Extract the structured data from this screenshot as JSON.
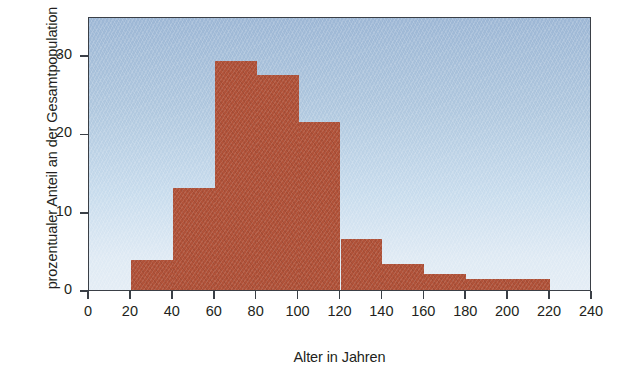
{
  "chart_data": {
    "type": "bar",
    "title": "",
    "subtitle": "",
    "xlabel": "Alter in Jahren",
    "ylabel": "prozentualer Anteil an der Gesamtpopulation",
    "xlim": [
      0,
      240
    ],
    "ylim": [
      0,
      35
    ],
    "bin_width": 20,
    "grid": false,
    "legend": null,
    "xticks": [
      0,
      20,
      40,
      60,
      80,
      100,
      120,
      140,
      160,
      180,
      200,
      220,
      240
    ],
    "xtick_labels": [
      "0",
      "20",
      "40",
      "60",
      "80",
      "100",
      "120",
      "140",
      "160",
      "180",
      "200",
      "220",
      "240"
    ],
    "yticks": [
      0,
      10,
      20,
      30
    ],
    "ytick_labels": [
      "0",
      "10",
      "20",
      "30"
    ],
    "categories": [
      "0-20",
      "20-40",
      "40-60",
      "60-80",
      "80-100",
      "100-120",
      "120-140",
      "140-160",
      "160-180",
      "180-200",
      "200-220",
      "220-240"
    ],
    "bin_starts": [
      0,
      20,
      40,
      60,
      80,
      100,
      120,
      140,
      160,
      180,
      200,
      220
    ],
    "values": [
      0,
      3.8,
      13.0,
      29.2,
      27.5,
      21.4,
      6.5,
      3.3,
      2.1,
      1.4,
      1.4,
      0
    ],
    "series": [
      {
        "name": "prozentualer Anteil an der Gesamtpopulation",
        "values": [
          0,
          3.8,
          13.0,
          29.2,
          27.5,
          21.4,
          6.5,
          3.3,
          2.1,
          1.4,
          1.4,
          0
        ]
      }
    ],
    "bar_color": "#b05239",
    "plot_background_top": "#9db7d5",
    "plot_background_bottom": "#e4edf5",
    "axis_color": "#3a3f46",
    "text_color": "#231f20"
  }
}
